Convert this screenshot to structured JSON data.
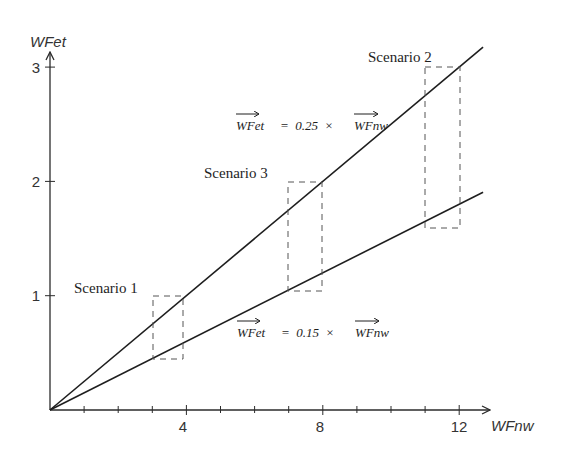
{
  "chart_data": {
    "type": "line",
    "title": "",
    "xlabel": "WFnw",
    "ylabel": "WFet",
    "xlim": [
      0,
      12.7
    ],
    "ylim": [
      0,
      3.2
    ],
    "x_ticks": [
      1,
      2,
      3,
      4,
      5,
      6,
      7,
      8,
      9,
      10,
      11,
      12
    ],
    "x_tick_labels": [
      {
        "value": 4,
        "label": "4"
      },
      {
        "value": 8,
        "label": "8"
      },
      {
        "value": 12,
        "label": "12"
      }
    ],
    "y_ticks": [
      1,
      2,
      3
    ],
    "y_tick_labels": [
      {
        "value": 1,
        "label": "1"
      },
      {
        "value": 2,
        "label": "2"
      },
      {
        "value": 3,
        "label": "3"
      }
    ],
    "grid": false,
    "series": [
      {
        "name": "WFet = 0.25 × WFnw",
        "slope": 0.25,
        "x": [
          0,
          12.7
        ],
        "y": [
          0,
          3.175
        ]
      },
      {
        "name": "WFet = 0.15 × WFnw",
        "slope": 0.15,
        "x": [
          0,
          12.7
        ],
        "y": [
          0,
          1.905
        ]
      }
    ],
    "annotations": [
      {
        "type": "equation",
        "text_lhs": "WFet",
        "text_mid": "=  0.25  ×",
        "text_rhs": "WFnw",
        "x": 5.2,
        "y": 2.55
      },
      {
        "type": "equation",
        "text_lhs": "WFet",
        "text_mid": "=  0.15  ×",
        "text_rhs": "WFnw",
        "x": 5.2,
        "y": 0.65
      }
    ],
    "scenarios": [
      {
        "label": "Scenario 1",
        "x_range": [
          3,
          4
        ],
        "y_range": [
          0.45,
          1.0
        ],
        "label_x": 0.7,
        "label_y": 1.08
      },
      {
        "label": "Scenario 3",
        "x_range": [
          7,
          8
        ],
        "y_range": [
          1.05,
          2.0
        ],
        "label_x": 4.6,
        "label_y": 2.08
      },
      {
        "label": "Scenario 2",
        "x_range": [
          11,
          12
        ],
        "y_range": [
          1.65,
          3.0
        ],
        "label_x": 9.9,
        "label_y": 3.28
      }
    ]
  },
  "labels": {
    "x_axis_title": "WFnw",
    "y_axis_title": "WFet",
    "x_tick_4": "4",
    "x_tick_8": "8",
    "x_tick_12": "12",
    "y_tick_1": "1",
    "y_tick_2": "2",
    "y_tick_3": "3",
    "scenario_1": "Scenario 1",
    "scenario_2": "Scenario 2",
    "scenario_3": "Scenario 3",
    "eq_upper_lhs": "WFet",
    "eq_upper_mid": "=  0.25  ×",
    "eq_upper_rhs": "WFnw",
    "eq_lower_lhs": "WFet",
    "eq_lower_mid": "=  0.15  ×",
    "eq_lower_rhs": "WFnw"
  }
}
